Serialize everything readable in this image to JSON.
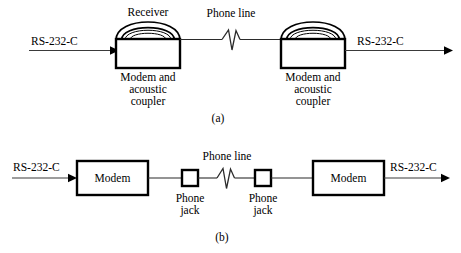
{
  "figure": {
    "title_a_caption": "(a)",
    "title_b_caption": "(b)",
    "panel_a": {
      "name": "acoustic-coupler-link",
      "left_interface_label": "RS-232-C",
      "right_interface_label": "RS-232-C",
      "receiver_label": "Receiver",
      "phone_line_label": "Phone line",
      "left_device_label_lines": [
        "Modem and",
        "acoustic",
        "coupler"
      ],
      "right_device_label_lines": [
        "Modem and",
        "acoustic",
        "coupler"
      ],
      "left_device_line1": "Modem and",
      "left_device_line2": "acoustic",
      "left_device_line3": "coupler",
      "right_device_line1": "Modem and",
      "right_device_line2": "acoustic",
      "right_device_line3": "coupler"
    },
    "panel_b": {
      "name": "direct-connect-modem-link",
      "left_interface_label": "RS-232-C",
      "right_interface_label": "RS-232-C",
      "left_modem_label": "Modem",
      "right_modem_label": "Modem",
      "phone_line_label": "Phone line",
      "left_jack_line1": "Phone",
      "left_jack_line2": "jack",
      "right_jack_line1": "Phone",
      "right_jack_line2": "jack"
    },
    "colors": {
      "background": "#ffffff",
      "ink": "#000000",
      "wire": "#2b2b2b",
      "arrow": "#3a3a3a"
    }
  }
}
